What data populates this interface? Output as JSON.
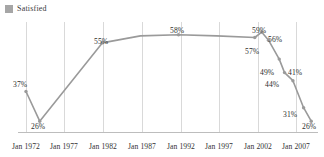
{
  "legend": {
    "label": "Satisfied",
    "swatch_color": "#a6a6a6",
    "icon": "square-swatch-icon"
  },
  "colors": {
    "line": "#9a9a9a",
    "marker": "#9a9a9a",
    "gridline": "#d9d9d9",
    "axis": "#bdbdbd",
    "label_text": "#2e2e2e"
  },
  "chart_data": {
    "type": "line",
    "title": "",
    "subtitle": "",
    "xlabel": "",
    "ylabel": "",
    "grid": "vertical",
    "legend_position": "top-left",
    "ylim": [
      22,
      62
    ],
    "xlim": [
      1972,
      2009.5
    ],
    "axis_ticks": [
      "Jan 1972",
      "Jan 1977",
      "Jan 1982",
      "Jan 1987",
      "Jan 1992",
      "Jan 1997",
      "Jan 2002",
      "Jan 2007"
    ],
    "tick_years": [
      1972,
      1977,
      1982,
      1987,
      1992,
      1997,
      2002,
      2007
    ],
    "series": [
      {
        "name": "Satisfied",
        "points": [
          {
            "x": 1972.0,
            "y": 37,
            "label": "37%"
          },
          {
            "x": 1973.8,
            "y": 26,
            "label": "26%"
          },
          {
            "x": 1982.0,
            "y": 55,
            "label": "55%"
          },
          {
            "x": 1987.0,
            "y": 57.6,
            "label": ""
          },
          {
            "x": 1992.0,
            "y": 58,
            "label": "58%"
          },
          {
            "x": 1997.0,
            "y": 57.6,
            "label": ""
          },
          {
            "x": 2002.0,
            "y": 57,
            "label": "57%"
          },
          {
            "x": 2002.9,
            "y": 59,
            "label": "59%"
          },
          {
            "x": 2003.8,
            "y": 56,
            "label": "56%"
          },
          {
            "x": 2005.2,
            "y": 49,
            "label": "49%"
          },
          {
            "x": 2005.9,
            "y": 44,
            "label": "44%"
          },
          {
            "x": 2007.0,
            "y": 41,
            "label": "41%"
          },
          {
            "x": 2008.4,
            "y": 31,
            "label": "31%"
          },
          {
            "x": 2009.4,
            "y": 26,
            "label": "26%"
          }
        ]
      }
    ],
    "values": [
      37,
      26,
      55,
      58,
      57,
      59,
      56,
      49,
      44,
      41,
      31,
      26
    ],
    "value_labels": [
      "37%",
      "26%",
      "55%",
      "58%",
      "57%",
      "59%",
      "56%",
      "49%",
      "44%",
      "41%",
      "31%",
      "26%"
    ]
  },
  "value_label_positions": [
    {
      "text": "37%",
      "left": 13,
      "top": 80,
      "name": "value-label-37"
    },
    {
      "text": "26%",
      "left": 31,
      "top": 122,
      "name": "value-label-26-early"
    },
    {
      "text": "55%",
      "left": 94,
      "top": 37,
      "name": "value-label-55"
    },
    {
      "text": "58%",
      "left": 170,
      "top": 26,
      "name": "value-label-58"
    },
    {
      "text": "57%",
      "left": 245,
      "top": 47,
      "name": "value-label-57"
    },
    {
      "text": "59%",
      "left": 252,
      "top": 26,
      "name": "value-label-59"
    },
    {
      "text": "56%",
      "left": 268,
      "top": 35,
      "name": "value-label-56"
    },
    {
      "text": "49%",
      "left": 260,
      "top": 68,
      "name": "value-label-49"
    },
    {
      "text": "44%",
      "left": 265,
      "top": 80,
      "name": "value-label-44"
    },
    {
      "text": "41%",
      "left": 288,
      "top": 68,
      "name": "value-label-41"
    },
    {
      "text": "31%",
      "left": 283,
      "top": 110,
      "name": "value-label-31"
    },
    {
      "text": "26%",
      "left": 302,
      "top": 122,
      "name": "value-label-26-late"
    }
  ],
  "xtick_positions": [
    {
      "text": "Jan 1972",
      "left": 26
    },
    {
      "text": "Jan 1977",
      "left": 64
    },
    {
      "text": "Jan 1982",
      "left": 103
    },
    {
      "text": "Jan 1987",
      "left": 142
    },
    {
      "text": "Jan 1992",
      "left": 181
    },
    {
      "text": "Jan 1997",
      "left": 219
    },
    {
      "text": "Jan 2002",
      "left": 258
    },
    {
      "text": "Jan 2007",
      "left": 296
    }
  ],
  "geometry": {
    "plot_left": 26,
    "plot_right": 312,
    "plot_top": 24,
    "plot_bottom": 132,
    "gridline_x": [
      26,
      64,
      103,
      142,
      181,
      219,
      258,
      296
    ]
  }
}
